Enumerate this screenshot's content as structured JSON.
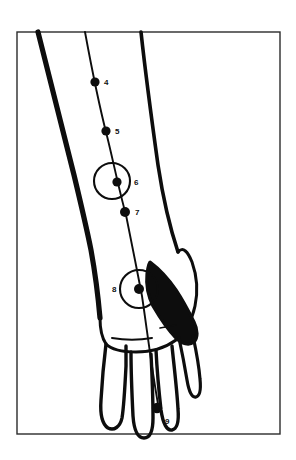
{
  "figure": {
    "background_color": "#ffffff",
    "ink_color": "#0d0d0d",
    "frame_color": "#2b2b2b",
    "frame": {
      "x": 17,
      "y": 32,
      "width": 263,
      "height": 402
    }
  },
  "meridian": {
    "name": "meridian-line",
    "stroke_color": "#0d0d0d",
    "path": "M 85 32 C 92 70, 99 105, 107 136 C 113 160, 119 190, 126 215 C 131 240, 137 270, 142 296 C 147 330, 152 370, 158 404"
  },
  "points": [
    {
      "id": "4",
      "label": "4",
      "cx": 95,
      "cy": 82,
      "r": 4.6,
      "label_x": 104,
      "label_y": 85,
      "circled": false
    },
    {
      "id": "5",
      "label": "5",
      "cx": 106,
      "cy": 131,
      "r": 4.6,
      "label_x": 115,
      "label_y": 134,
      "circled": false
    },
    {
      "id": "6",
      "label": "6",
      "cx": 117,
      "cy": 182,
      "r": 4.6,
      "label_x": 134,
      "label_y": 185,
      "circled": true,
      "circle_cx": 112,
      "circle_cy": 181,
      "circle_r": 18
    },
    {
      "id": "7",
      "label": "7",
      "cx": 125,
      "cy": 212,
      "r": 5.0,
      "label_x": 135,
      "label_y": 215,
      "circled": false
    },
    {
      "id": "8",
      "label": "8",
      "cx": 139,
      "cy": 289,
      "r": 5.0,
      "label_x": 112,
      "label_y": 292,
      "circled": true,
      "circle_cx": 139,
      "circle_cy": 289,
      "circle_r": 19
    },
    {
      "id": "9",
      "label": "9",
      "cx": 157,
      "cy": 408,
      "r": 5.2,
      "label_x": 165,
      "label_y": 424,
      "circled": false
    }
  ],
  "outlines": {
    "forearm_left_edge": "M 38 32 C 50 80, 62 128, 74 175 C 80 200, 86 225, 91 250 C 95 272, 98 295, 100 318",
    "forearm_right_edge": "M 141 32 C 146 78, 152 122, 158 165 C 163 198, 170 228, 178 252",
    "hand_outline": "M 100 318 C 100 330, 102 338, 106 344 C 112 350, 124 352, 136 352 C 150 352, 165 348, 176 340 C 186 332, 192 320, 195 306 C 198 292, 197 276, 192 262 C 188 252, 183 246, 178 252",
    "thumb_outline": "M 150 262 C 158 268, 168 278, 176 290 C 184 302, 190 314, 194 322 C 198 330, 198 338, 194 342 C 189 346, 182 344, 176 338 C 168 330, 160 318, 153 306 C 148 296, 146 284, 147 274 C 148 266, 149 262, 150 262 Z",
    "finger_index": "M 106 344 C 104 360, 102 382, 101 400 C 100 414, 102 424, 108 428 C 114 431, 120 427, 122 418 C 124 406, 125 386, 126 366 C 126 356, 126 350, 126 346",
    "finger_middle": "M 131 352 C 131 372, 132 396, 133 416 C 134 430, 138 438, 144 438 C 150 438, 153 430, 153 418 C 153 398, 152 374, 151 354",
    "finger_ring": "M 156 350 C 157 370, 159 392, 161 410 C 163 424, 167 431, 172 430 C 177 429, 179 421, 178 409 C 177 390, 174 366, 172 346",
    "finger_little": "M 179 338 C 182 352, 185 368, 187 380 C 189 392, 192 398, 196 397 C 200 396, 201 389, 200 379 C 199 366, 196 350, 193 336",
    "knuckle_crease": "M 112 338 C 124 340, 140 340, 152 338",
    "knuckle_crease_2": "M 160 328 C 166 327, 172 326, 176 325"
  }
}
